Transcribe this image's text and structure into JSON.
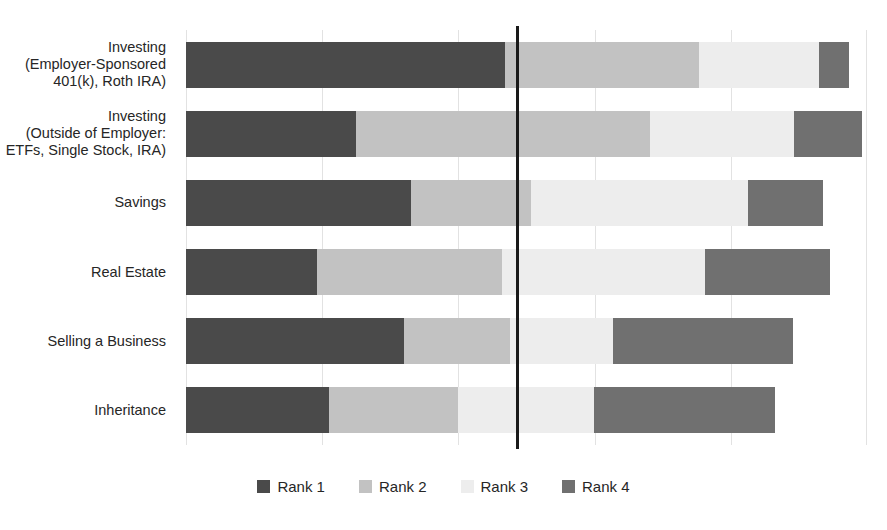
{
  "chart_data": {
    "type": "bar",
    "subtype": "stacked-horizontal-100",
    "title": "",
    "xlabel": "",
    "ylabel": "",
    "xlim": [
      0,
      100
    ],
    "grid": true,
    "gridlines_pct": [
      0,
      20,
      40,
      60,
      80,
      100
    ],
    "legend_position": "bottom",
    "categories": [
      "Investing\n(Employer-Sponsored\n401(k), Roth IRA)",
      "Investing\n(Outside of Employer:\nETFs, Single Stock, IRA)",
      "Savings",
      "Real Estate",
      "Selling a Business",
      "Inheritance"
    ],
    "series": [
      {
        "name": "Rank 1",
        "color": "#4a4a4a",
        "values": [
          46.8,
          25.0,
          33.0,
          19.2,
          32.0,
          21.0
        ]
      },
      {
        "name": "Rank 2",
        "color": "#c2c2c2",
        "values": [
          28.6,
          43.2,
          17.6,
          27.2,
          15.6,
          18.9
        ]
      },
      {
        "name": "Rank 3",
        "color": "#ededed",
        "values": [
          17.6,
          21.1,
          31.9,
          29.8,
          15.1,
          20.0
        ]
      },
      {
        "name": "Rank 4",
        "color": "#707070",
        "values": [
          4.3,
          10.0,
          11.0,
          18.4,
          26.4,
          26.6
        ]
      }
    ],
    "annotations": [
      {
        "name": "median-reference-line",
        "type": "vline",
        "x_pct": 48.5,
        "color": "#1a1a1a"
      }
    ]
  },
  "categories": [
    {
      "id": "investing-employer-sponsored",
      "lines": [
        "Investing",
        "(Employer-Sponsored",
        "401(k), Roth IRA)"
      ]
    },
    {
      "id": "investing-outside-employer",
      "lines": [
        "Investing",
        "(Outside of Employer:",
        "ETFs, Single Stock, IRA)"
      ]
    },
    {
      "id": "savings",
      "lines": [
        "Savings"
      ]
    },
    {
      "id": "real-estate",
      "lines": [
        "Real Estate"
      ]
    },
    {
      "id": "selling-a-business",
      "lines": [
        "Selling a Business"
      ]
    },
    {
      "id": "inheritance",
      "lines": [
        "Inheritance"
      ]
    }
  ],
  "legend": {
    "items": [
      {
        "label": "Rank 1",
        "color": "#4a4a4a"
      },
      {
        "label": "Rank 2",
        "color": "#c2c2c2"
      },
      {
        "label": "Rank 3",
        "color": "#ededed"
      },
      {
        "label": "Rank 4",
        "color": "#707070"
      }
    ]
  },
  "colors": {
    "rank1": "#4a4a4a",
    "rank2": "#c2c2c2",
    "rank3": "#ededed",
    "rank4": "#707070",
    "gridline": "#e2e2e2",
    "reference_line": "#1a1a1a",
    "background": "#ffffff",
    "text": "#262626"
  }
}
